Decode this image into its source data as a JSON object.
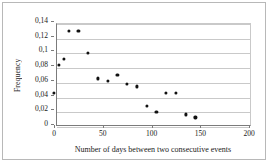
{
  "chart_data": {
    "type": "scatter",
    "title": "",
    "xlabel": "Number of days between two consecutive events",
    "ylabel": "Frequency",
    "xlim": [
      0,
      200
    ],
    "ylim": [
      0,
      0.14
    ],
    "grid": true,
    "legend": null,
    "decimal_separator": ",",
    "xticks": [
      "0",
      "50",
      "100",
      "150",
      "200"
    ],
    "xtick_values": [
      0,
      50,
      100,
      150,
      200
    ],
    "yticks": [
      "0",
      "0,02",
      "0,04",
      "0,06",
      "0,08",
      "0,1",
      "0,12",
      "0,14"
    ],
    "ytick_values": [
      0,
      0.02,
      0.04,
      0.06,
      0.08,
      0.1,
      0.12,
      0.14
    ],
    "x": [
      0,
      5,
      10,
      15,
      25,
      35,
      45,
      55,
      65,
      75,
      85,
      95,
      105,
      115,
      125,
      135,
      145
    ],
    "y": [
      0.042,
      0.08,
      0.088,
      0.126,
      0.126,
      0.097,
      0.062,
      0.059,
      0.067,
      0.055,
      0.051,
      0.025,
      0.016,
      0.042,
      0.042,
      0.013,
      0.009
    ],
    "marker": "filled-circle",
    "marker_color": "#111111"
  }
}
